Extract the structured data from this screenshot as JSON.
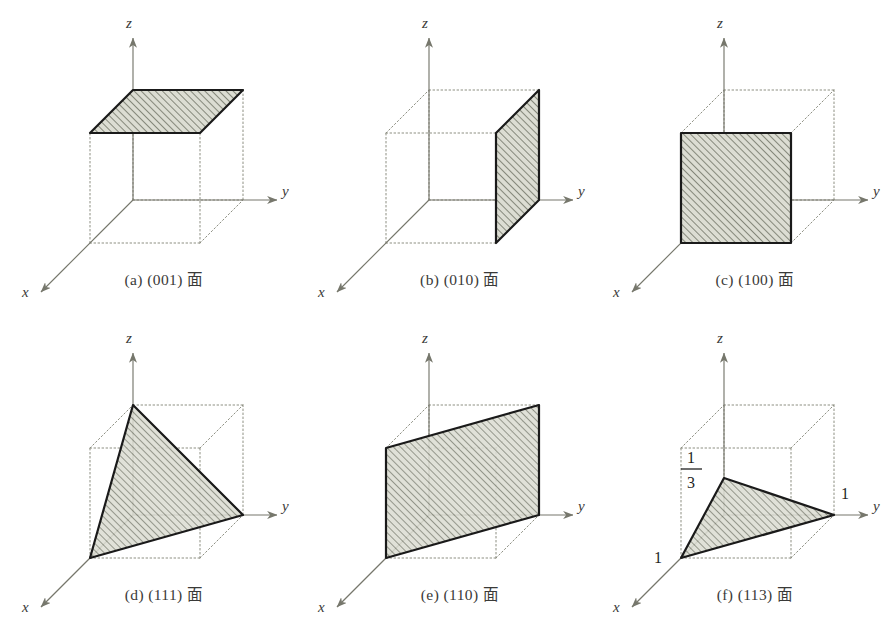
{
  "figure": {
    "background_color": "#ffffff",
    "plane_fill_color": "#d8d9cf",
    "hatch_color": "#6f7265",
    "outline_color": "#1a1a1a",
    "dotted_edge_color": "#8d8f82",
    "axis_color": "#76776c",
    "label_color": "#3a3a38",
    "columns": 3,
    "rows": 2
  },
  "axes": {
    "z_label": "z",
    "y_label": "y",
    "x_label": "x"
  },
  "panels": [
    {
      "id": "a",
      "index_label": "(a)",
      "miller": "(001)",
      "suffix": "面",
      "caption": "(a) (001) 面",
      "plane_type": "face-top",
      "intercept_labels": []
    },
    {
      "id": "b",
      "index_label": "(b)",
      "miller": "(010)",
      "suffix": "面",
      "caption": "(b) (010) 面",
      "plane_type": "face-right",
      "intercept_labels": []
    },
    {
      "id": "c",
      "index_label": "(c)",
      "miller": "(100)",
      "suffix": "面",
      "caption": "(c) (100) 面",
      "plane_type": "face-front",
      "intercept_labels": []
    },
    {
      "id": "d",
      "index_label": "(d)",
      "miller": "(111)",
      "suffix": "面",
      "caption": "(d) (111) 面",
      "plane_type": "triangle-111",
      "intercept_labels": []
    },
    {
      "id": "e",
      "index_label": "(e)",
      "miller": "(110)",
      "suffix": "面",
      "caption": "(e) (110) 面",
      "plane_type": "diagonal-110",
      "intercept_labels": []
    },
    {
      "id": "f",
      "index_label": "(f)",
      "miller": "(113)",
      "suffix": "面",
      "caption": "(f) (113) 面",
      "plane_type": "triangle-113",
      "intercept_labels": [
        {
          "axis": "z",
          "text_numerator": "1",
          "text_denominator": "3",
          "is_fraction": true
        },
        {
          "axis": "y",
          "text": "1",
          "is_fraction": false
        },
        {
          "axis": "x",
          "text": "1",
          "is_fraction": false
        }
      ]
    }
  ]
}
